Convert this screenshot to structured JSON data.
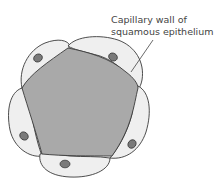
{
  "diagram": {
    "label": {
      "line1": "Capillary wall of",
      "line2": "squamous epithelium"
    },
    "colors": {
      "lumen": "#a9a9a9",
      "cell": "#efefef",
      "nucleus": "#7a7a7a",
      "outline": "#3a3a3a"
    },
    "cell_count": 5
  }
}
